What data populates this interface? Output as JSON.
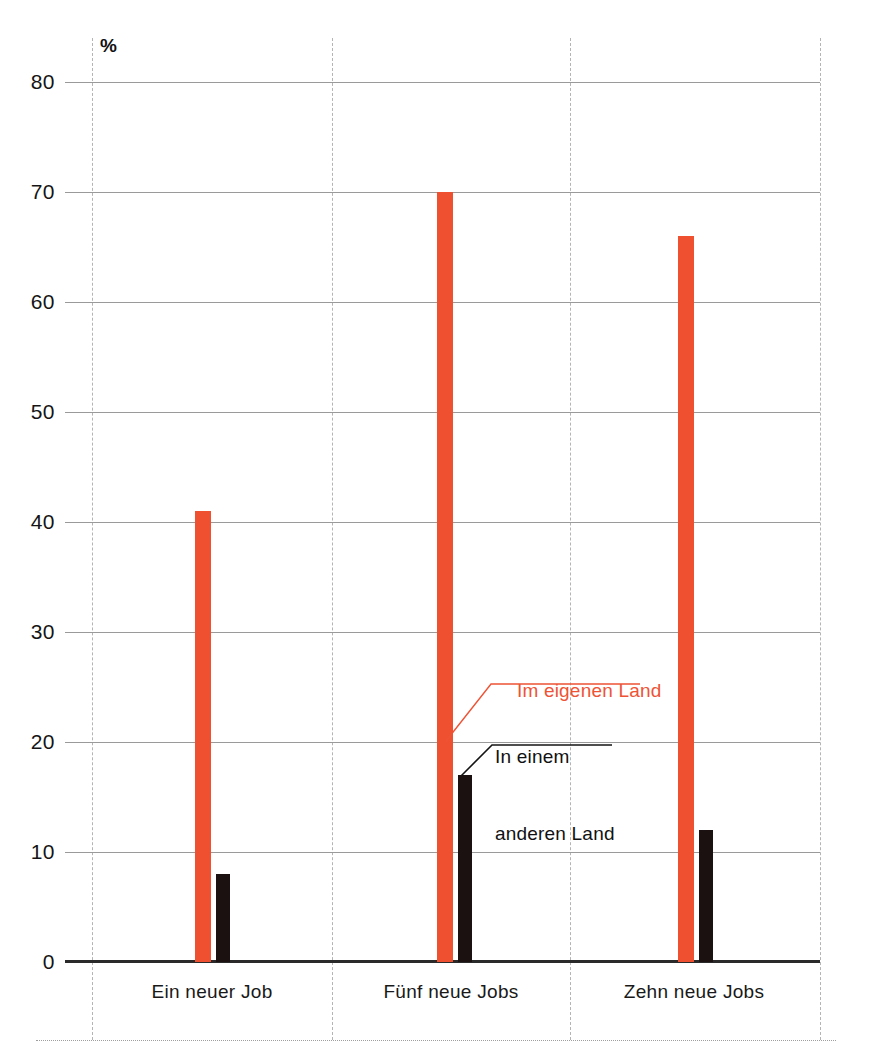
{
  "chart_data": {
    "type": "bar",
    "title": "",
    "subtitle": "",
    "xlabel": "",
    "ylabel": "%",
    "unit_caption": "%",
    "ylim": [
      0,
      80
    ],
    "ytick_step": 10,
    "yticks": [
      80,
      70,
      60,
      50,
      40,
      30,
      20,
      10,
      0
    ],
    "ytick_labels": [
      "80",
      "70",
      "60",
      "50",
      "40",
      "30",
      "20",
      "10",
      "0"
    ],
    "grid": "horizontal",
    "legend_position": "inline-annotation",
    "categories": [
      "Ein neuer Job",
      "Fünf neue Jobs",
      "Zehn neue Jobs"
    ],
    "series": [
      {
        "name": "Im eigenen Land",
        "color": "#ef5130",
        "values": [
          41,
          70,
          66
        ]
      },
      {
        "name": "In einem anderen Land",
        "color": "#1c1111",
        "values": [
          8,
          17,
          12
        ]
      }
    ],
    "annotations": [
      {
        "text": "Im eigenen Land",
        "color": "#ee5335",
        "target_series": "Im eigenen Land"
      },
      {
        "text": "In einem\nanderen Land",
        "line1": "In einem",
        "line2": "anderen Land",
        "color": "#111111",
        "target_series": "In einem anderen Land"
      }
    ]
  },
  "axis": {
    "unit": "%",
    "ticks": [
      {
        "value": "80"
      },
      {
        "value": "70"
      },
      {
        "value": "60"
      },
      {
        "value": "50"
      },
      {
        "value": "40"
      },
      {
        "value": "30"
      },
      {
        "value": "20"
      },
      {
        "value": "10"
      },
      {
        "value": "0"
      }
    ]
  },
  "categories": [
    {
      "label": "Ein neuer Job"
    },
    {
      "label": "Fünf neue Jobs"
    },
    {
      "label": "Zehn neue Jobs"
    }
  ],
  "annotations": {
    "own_land": "Im eigenen Land",
    "other_land_line1": "In einem",
    "other_land_line2": "anderen Land"
  },
  "colors": {
    "own_land": "#ef5130",
    "other_land": "#1c1111",
    "gridline": "#9a9a9a",
    "baseline": "#2a2a2a",
    "separator": "#b4b4b4",
    "background": "#ffffff"
  }
}
